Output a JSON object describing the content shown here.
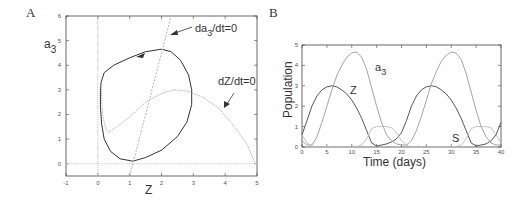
{
  "panels": {
    "A": {
      "label": "A",
      "xlabel": "Z",
      "ylabel_main": "a",
      "ylabel_sub": "3",
      "xticks": [
        "-1",
        "0",
        "1",
        "2",
        "3",
        "4",
        "5"
      ],
      "yticks": [
        "0",
        "1",
        "2",
        "3",
        "4",
        "5",
        "6"
      ],
      "annot_da3_main": "da",
      "annot_da3_sub": "3",
      "annot_da3_rest": "/dt=0",
      "annot_dz": "dZ/dt=0"
    },
    "B": {
      "label": "B",
      "xlabel": "Time (days)",
      "ylabel": "Population",
      "xticks": [
        "0",
        "5",
        "10",
        "15",
        "20",
        "25",
        "30",
        "35",
        "40"
      ],
      "yticks": [
        "0",
        "1",
        "2",
        "3",
        "4",
        "5"
      ],
      "label_a3_main": "a",
      "label_a3_sub": "3",
      "label_Z": "Z",
      "label_S": "S"
    }
  },
  "chart_data": [
    {
      "type": "line",
      "title": "A",
      "xlabel": "Z",
      "ylabel": "a3",
      "xlim": [
        -1,
        5
      ],
      "ylim": [
        -0.5,
        6
      ],
      "grid": false,
      "series": [
        {
          "name": "limit cycle (trajectory)",
          "color": "#333333",
          "points": [
            [
              0.1,
              3.3
            ],
            [
              0.2,
              3.7
            ],
            [
              0.5,
              4.0
            ],
            [
              1.0,
              4.3
            ],
            [
              1.5,
              4.55
            ],
            [
              2.0,
              4.65
            ],
            [
              2.3,
              4.55
            ],
            [
              2.6,
              4.2
            ],
            [
              2.85,
              3.6
            ],
            [
              2.95,
              3.0
            ],
            [
              2.95,
              2.4
            ],
            [
              2.8,
              1.7
            ],
            [
              2.5,
              1.1
            ],
            [
              2.0,
              0.55
            ],
            [
              1.5,
              0.25
            ],
            [
              1.1,
              0.1
            ],
            [
              0.7,
              0.2
            ],
            [
              0.4,
              0.5
            ],
            [
              0.2,
              1.0
            ],
            [
              0.12,
              1.6
            ],
            [
              0.08,
              2.3
            ],
            [
              0.08,
              2.9
            ],
            [
              0.1,
              3.3
            ]
          ]
        },
        {
          "name": "dZ/dt=0 nullcline",
          "color": "#aaaaaa",
          "points": [
            [
              0.1,
              3.2
            ],
            [
              0.15,
              2.0
            ],
            [
              0.25,
              1.4
            ],
            [
              0.35,
              1.3
            ],
            [
              0.6,
              1.5
            ],
            [
              1.0,
              1.9
            ],
            [
              1.5,
              2.5
            ],
            [
              2.0,
              2.85
            ],
            [
              2.4,
              3.0
            ],
            [
              2.8,
              2.95
            ],
            [
              3.3,
              2.7
            ],
            [
              3.8,
              2.25
            ],
            [
              4.3,
              1.5
            ],
            [
              4.7,
              0.75
            ],
            [
              4.95,
              0.0
            ]
          ]
        },
        {
          "name": "da3/dt=0 nullcline",
          "color": "#aaaaaa",
          "points": [
            [
              1.0,
              -0.5
            ],
            [
              2.3,
              6.0
            ]
          ]
        },
        {
          "name": "Z=0 axis nullcline",
          "color": "#bbbbbb",
          "points": [
            [
              0.0,
              -0.5
            ],
            [
              0.0,
              6.0
            ]
          ]
        },
        {
          "name": "a3=0 line",
          "color": "#cccccc",
          "points": [
            [
              -1,
              0
            ],
            [
              5,
              0
            ]
          ]
        }
      ],
      "annotations": [
        "da3/dt=0",
        "dZ/dt=0"
      ]
    },
    {
      "type": "line",
      "title": "B",
      "xlabel": "Time (days)",
      "ylabel": "Population",
      "xlim": [
        0,
        40
      ],
      "ylim": [
        0,
        5
      ],
      "grid": false,
      "series": [
        {
          "name": "Z",
          "color": "#444444",
          "x": [
            0,
            1,
            2,
            3,
            4,
            5,
            6,
            7,
            8,
            9,
            10,
            11,
            12,
            13,
            14,
            15,
            16,
            17,
            18,
            19,
            20,
            21,
            22,
            23,
            24,
            25,
            26,
            27,
            28,
            29,
            30,
            31,
            32,
            33,
            34,
            35,
            36,
            37,
            38,
            39,
            40
          ],
          "values": [
            0.6,
            1.3,
            2.0,
            2.5,
            2.8,
            2.95,
            3.0,
            2.95,
            2.8,
            2.6,
            2.3,
            1.9,
            1.4,
            0.8,
            0.2,
            0.05,
            0.1,
            0.15,
            0.25,
            0.4,
            0.7,
            1.3,
            2.0,
            2.5,
            2.8,
            2.95,
            3.0,
            2.95,
            2.8,
            2.6,
            2.3,
            1.9,
            1.4,
            0.8,
            0.2,
            0.05,
            0.1,
            0.15,
            0.3,
            0.6,
            1.2
          ]
        },
        {
          "name": "a3",
          "color": "#999999",
          "x": [
            0,
            1,
            2,
            3,
            4,
            5,
            6,
            7,
            8,
            9,
            10,
            11,
            12,
            13,
            14,
            15,
            16,
            17,
            18,
            19,
            20,
            21,
            22,
            23,
            24,
            25,
            26,
            27,
            28,
            29,
            30,
            31,
            32,
            33,
            34,
            35,
            36,
            37,
            38,
            39,
            40
          ],
          "values": [
            0.3,
            0.1,
            0.1,
            0.5,
            1.2,
            2.0,
            2.8,
            3.5,
            4.0,
            4.4,
            4.62,
            4.65,
            4.4,
            3.8,
            2.9,
            2.0,
            1.2,
            0.6,
            0.3,
            0.15,
            0.1,
            0.1,
            0.3,
            0.8,
            1.5,
            2.3,
            3.1,
            3.7,
            4.2,
            4.5,
            4.65,
            4.6,
            4.3,
            3.6,
            2.7,
            1.8,
            1.0,
            0.5,
            0.2,
            0.1,
            0.1
          ]
        },
        {
          "name": "S",
          "color": "#bbbbbb",
          "x": [
            0,
            1,
            2,
            3,
            4,
            5,
            6,
            7,
            8,
            9,
            10,
            11,
            12,
            13,
            14,
            15,
            16,
            17,
            18,
            19,
            20,
            21,
            22,
            23,
            24,
            25,
            26,
            27,
            28,
            29,
            30,
            31,
            32,
            33,
            34,
            35,
            36,
            37,
            38,
            39,
            40
          ],
          "values": [
            0.6,
            0.2,
            0.05,
            0,
            0,
            0,
            0,
            0,
            0,
            0,
            0,
            0.02,
            0.1,
            0.4,
            0.9,
            1.0,
            1.0,
            1.0,
            0.95,
            0.7,
            0.3,
            0.1,
            0,
            0,
            0,
            0,
            0,
            0,
            0,
            0,
            0,
            0.02,
            0.1,
            0.4,
            0.9,
            1.0,
            1.0,
            1.0,
            0.95,
            0.6,
            0.2
          ]
        }
      ],
      "annotations": [
        "a3",
        "Z",
        "S"
      ]
    }
  ]
}
